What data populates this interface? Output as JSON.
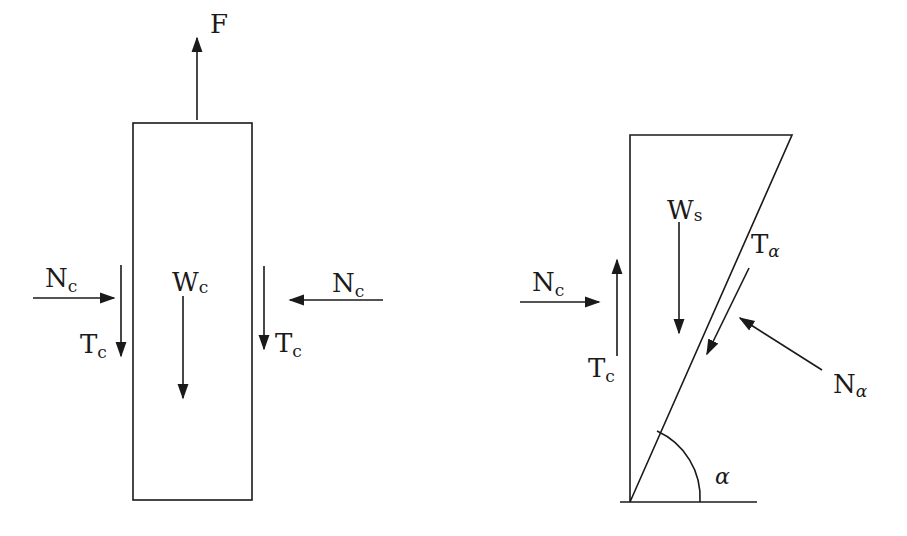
{
  "diagram": {
    "colors": {
      "stroke": "#1a1a1a",
      "background": "#ffffff"
    },
    "left_body": {
      "name": "column",
      "forces": {
        "F": {
          "main": "F",
          "sub": ""
        },
        "Nc_left": {
          "main": "N",
          "sub": "c"
        },
        "Tc_left": {
          "main": "T",
          "sub": "c"
        },
        "Wc": {
          "main": "W",
          "sub": "c"
        },
        "Tc_right": {
          "main": "T",
          "sub": "c"
        },
        "Nc_right": {
          "main": "N",
          "sub": "c"
        }
      }
    },
    "right_body": {
      "name": "soil-wedge",
      "forces": {
        "Nc": {
          "main": "N",
          "sub": "c"
        },
        "Tc": {
          "main": "T",
          "sub": "c"
        },
        "Ws": {
          "main": "W",
          "sub": "s"
        },
        "Talpha": {
          "main": "T",
          "sub": "α"
        },
        "Nalpha": {
          "main": "N",
          "sub": "α"
        }
      },
      "angle_label": "α"
    }
  }
}
